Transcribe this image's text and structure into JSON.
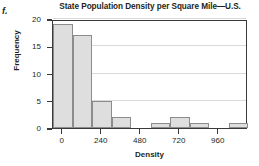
{
  "figure": {
    "part_label": "f."
  },
  "chart_data": {
    "type": "bar",
    "title": "State Population Density per Square Mile—U.S.",
    "xlabel": "Density",
    "ylabel": "Frequency",
    "grid": true,
    "legend": "none",
    "bin_width": 120,
    "bin_starts": [
      -60,
      60,
      180,
      300,
      420,
      540,
      660,
      780,
      900,
      1020
    ],
    "categories": [
      "-60",
      "60",
      "180",
      "300",
      "420",
      "540",
      "660",
      "780",
      "900",
      "1020"
    ],
    "values": [
      19,
      17,
      5,
      2,
      0,
      1,
      2,
      1,
      0,
      1
    ],
    "xlim": [
      -60,
      1140
    ],
    "ylim": [
      0,
      20
    ],
    "xticks": [
      0,
      240,
      480,
      720,
      960
    ],
    "xtick_labels": [
      "0",
      "240",
      "480",
      "720",
      "960"
    ],
    "yticks": [
      0,
      5,
      10,
      15,
      20
    ],
    "ytick_labels": [
      "0",
      "5",
      "10",
      "15",
      "20"
    ],
    "bar_fill_color": "#dedede",
    "bar_edge_color": "#8c8c8c",
    "axis_color": "#3a3a3a",
    "gridline_color": "#d9d9d9"
  }
}
